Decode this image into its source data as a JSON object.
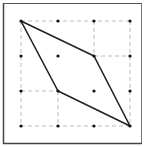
{
  "diagram": {
    "type": "dot-grid-quadrilateral",
    "grid": {
      "columns": 4,
      "rows": 4,
      "x_positions": [
        21,
        58,
        94,
        130
      ],
      "y_positions": [
        21,
        56,
        91,
        126
      ],
      "dot_color": "#111111"
    },
    "frame": {
      "x": 3,
      "y": 3,
      "width": 139,
      "height": 141,
      "stroke": "#555555",
      "fill": "#ffffff"
    },
    "dashed_lines": [
      {
        "x1": 21,
        "y1": 21,
        "x2": 130,
        "y2": 21
      },
      {
        "x1": 130,
        "y1": 21,
        "x2": 130,
        "y2": 126
      },
      {
        "x1": 21,
        "y1": 21,
        "x2": 21,
        "y2": 126
      },
      {
        "x1": 21,
        "y1": 126,
        "x2": 130,
        "y2": 126
      },
      {
        "x1": 94,
        "y1": 56,
        "x2": 130,
        "y2": 56
      },
      {
        "x1": 21,
        "y1": 91,
        "x2": 58,
        "y2": 91
      },
      {
        "x1": 58,
        "y1": 91,
        "x2": 58,
        "y2": 126
      },
      {
        "x1": 94,
        "y1": 21,
        "x2": 94,
        "y2": 56
      }
    ],
    "dash_color": "#bbbbbb",
    "shape": {
      "name": "parallelogram",
      "vertices": [
        [
          21,
          21
        ],
        [
          94,
          56
        ],
        [
          130,
          126
        ],
        [
          58,
          91
        ]
      ],
      "stroke": "#222222"
    }
  }
}
